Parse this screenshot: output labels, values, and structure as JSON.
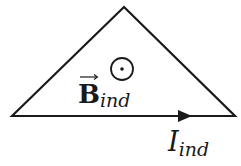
{
  "diagram": {
    "shape": "triangle",
    "stroke_color": "#1a1a1a",
    "field": {
      "symbol": "B",
      "subscript": "ind",
      "direction": "out-of-page",
      "icon": "dot-in-circle"
    },
    "current": {
      "symbol": "I",
      "subscript": "ind",
      "direction": "right"
    }
  }
}
